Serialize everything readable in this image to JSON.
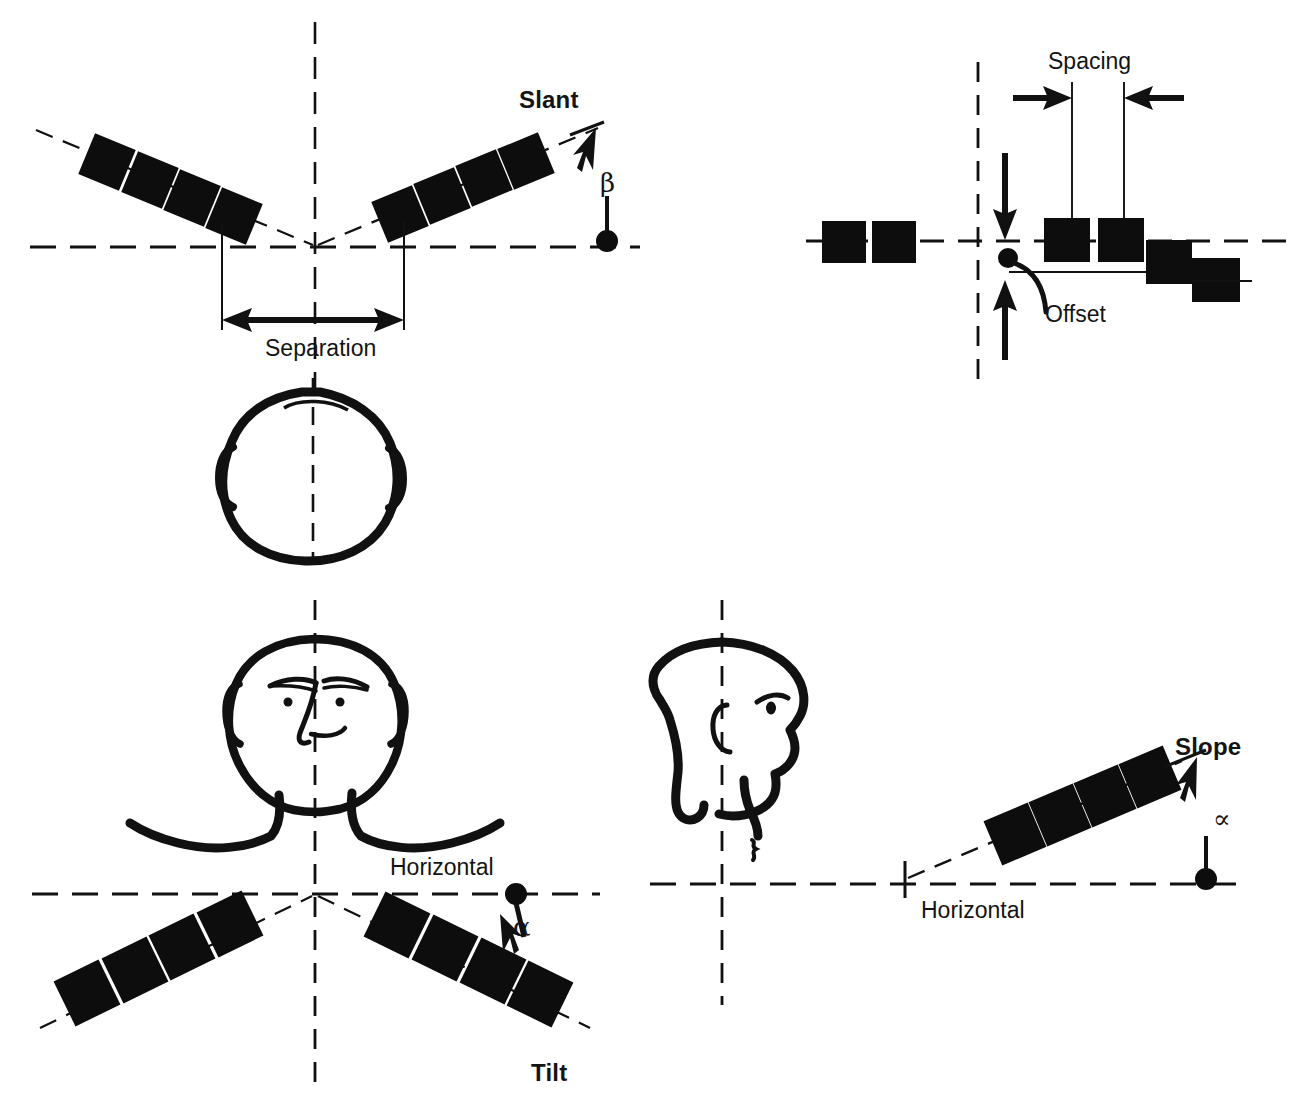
{
  "figure": {
    "type": "diagram",
    "background_color": "#ffffff",
    "ink_color": "#111111"
  },
  "panels": [
    {
      "id": "slant",
      "position": "top-left",
      "title": "Slant",
      "angle_symbol": "β",
      "dimension_label": "Separation",
      "view": "top-view of skull with vertical midline",
      "blocks_per_arm": 4,
      "arms": 2
    },
    {
      "id": "spacing-offset",
      "position": "top-right",
      "title": "",
      "labels": [
        "Spacing",
        "Offset"
      ],
      "blocks_on_axis": 4,
      "blocks_below_axis": 2
    },
    {
      "id": "tilt",
      "position": "bottom-left",
      "title": "Tilt",
      "angle_symbol": "α",
      "reference_label": "Horizontal",
      "view": "frontal face with vertical midline",
      "blocks_per_arm": 4,
      "arms": 2
    },
    {
      "id": "slope",
      "position": "bottom-right",
      "title": "Slope",
      "angle_symbol": "∝",
      "reference_label": "Horizontal",
      "view": "profile head facing right with vertical axis",
      "blocks": 4
    }
  ],
  "labels": {
    "slant": "Slant",
    "beta": "β",
    "separation": "Separation",
    "spacing": "Spacing",
    "offset": "Offset",
    "horizontal_left": "Horizontal",
    "horizontal_right": "Horizontal",
    "tilt": "Tilt",
    "slope": "Slope",
    "alpha_tilt": "α",
    "alpha_slope": "∝"
  },
  "colors": {
    "ink": "#111111",
    "paper": "#ffffff",
    "block_fill": "#0d0d0d"
  }
}
